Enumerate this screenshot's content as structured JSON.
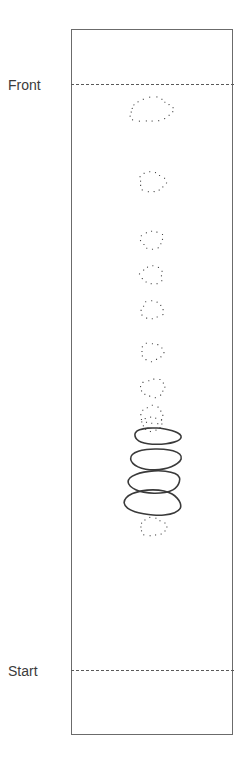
{
  "figure": {
    "type": "schematic-diagram",
    "background_color": "#ffffff",
    "channel": {
      "name": "channel-outline",
      "stroke_color": "#6b6b6b",
      "fill_color": "#ffffff",
      "x": 71,
      "y": 29,
      "width": 162,
      "height": 706
    },
    "reference_lines": [
      {
        "id": "front",
        "label": "Front",
        "y": 84,
        "style": "dashed",
        "color": "#595959"
      },
      {
        "id": "start",
        "label": "Start",
        "y": 670,
        "style": "dashed",
        "color": "#595959"
      }
    ],
    "shapes": {
      "dotted": {
        "style": "dotted-outline",
        "color": "#4a4a4a",
        "count": 10,
        "items": [
          {
            "cx": 151,
            "cy": 110,
            "rx": 21,
            "ry": 12,
            "rot": -6
          },
          {
            "cx": 152,
            "cy": 182,
            "rx": 13,
            "ry": 10,
            "rot": 4
          },
          {
            "cx": 152,
            "cy": 240,
            "rx": 11,
            "ry": 9,
            "rot": -3
          },
          {
            "cx": 152,
            "cy": 275,
            "rx": 11,
            "ry": 9,
            "rot": 5
          },
          {
            "cx": 152,
            "cy": 310,
            "rx": 11,
            "ry": 9,
            "rot": -2
          },
          {
            "cx": 152,
            "cy": 352,
            "rx": 11,
            "ry": 9,
            "rot": 3
          },
          {
            "cx": 153,
            "cy": 388,
            "rx": 12,
            "ry": 9,
            "rot": -4
          },
          {
            "cx": 152,
            "cy": 415,
            "rx": 11,
            "ry": 9,
            "rot": 2
          },
          {
            "cx": 153,
            "cy": 527,
            "rx": 13,
            "ry": 9,
            "rot": 0
          },
          {
            "cx": 152,
            "cy": 424,
            "rx": 10,
            "ry": 7,
            "rot": 0
          }
        ]
      },
      "solid": {
        "style": "solid-outline",
        "color": "#3a3a3a",
        "stroke_width": 1.6,
        "count": 4,
        "items": [
          {
            "id": "blob-1",
            "cx": 157,
            "cy": 436,
            "rx": 23,
            "ry": 9
          },
          {
            "id": "blob-2",
            "cx": 155,
            "cy": 459,
            "rx": 24,
            "ry": 12
          },
          {
            "id": "blob-3",
            "cx": 154,
            "cy": 482,
            "rx": 27,
            "ry": 12
          },
          {
            "id": "blob-4",
            "cx": 153,
            "cy": 503,
            "rx": 28,
            "ry": 14
          }
        ]
      }
    }
  }
}
